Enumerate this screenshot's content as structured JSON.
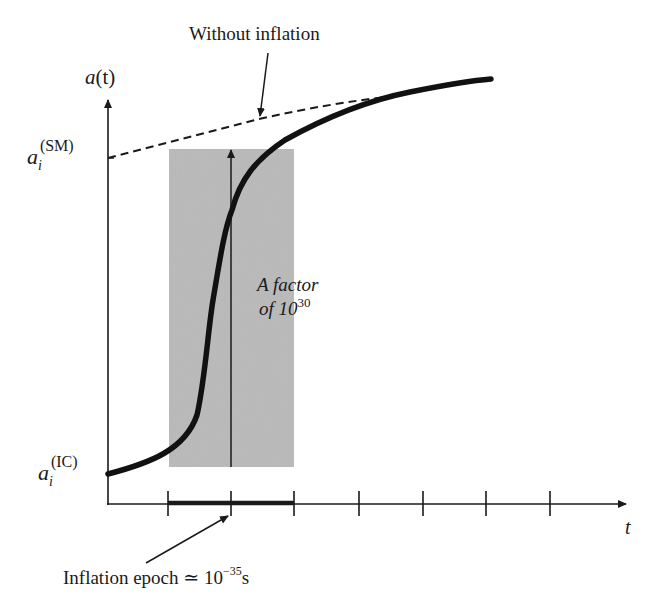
{
  "diagram": {
    "y_axis": {
      "label_main": "a",
      "label_paren": "(t)"
    },
    "x_axis": {
      "label": "t",
      "tick_count": 7
    },
    "labels": {
      "without_inflation": "Without inflation",
      "a_sm_base": "a",
      "a_sm_sub": "i",
      "a_sm_sup": "(SM)",
      "a_ic_base": "a",
      "a_ic_sub": "i",
      "a_ic_sup": "(IC)",
      "factor_line1": "A factor",
      "factor_line2_prefix": "of 10",
      "factor_line2_exp": "30",
      "epoch_prefix": "Inflation epoch ≃ 10",
      "epoch_exp": "−35",
      "epoch_unit": "s"
    },
    "colors": {
      "ink": "#1a1a1a",
      "shade": "#bdbdbd",
      "background": "#ffffff"
    }
  }
}
